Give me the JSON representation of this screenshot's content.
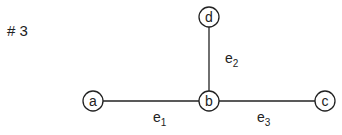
{
  "title": "# 3",
  "nodes": [
    {
      "id": "a",
      "label": "a",
      "cx": 93,
      "cy": 101
    },
    {
      "id": "b",
      "label": "b",
      "cx": 209,
      "cy": 101
    },
    {
      "id": "c",
      "label": "c",
      "cx": 325,
      "cy": 101
    },
    {
      "id": "d",
      "label": "d",
      "cx": 209,
      "cy": 17
    }
  ],
  "edges": [
    {
      "id": "e1",
      "label": "e",
      "sub": "1",
      "from": "a",
      "to": "b"
    },
    {
      "id": "e2",
      "label": "e",
      "sub": "2",
      "from": "d",
      "to": "b"
    },
    {
      "id": "e3",
      "label": "e",
      "sub": "3",
      "from": "b",
      "to": "c"
    }
  ]
}
